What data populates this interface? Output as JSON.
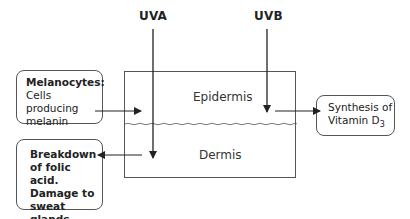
{
  "diagram": {
    "radiation": {
      "uva": {
        "label": "UVA"
      },
      "uvb": {
        "label": "UVB"
      }
    },
    "skin_layers": {
      "epidermis": "Epidermis",
      "dermis": "Dermis"
    },
    "callouts": {
      "melanocytes": {
        "title": "Melanocytes:",
        "line1": "Cells producing",
        "line2": "melanin"
      },
      "uva_effect": {
        "line1": "Breakdown",
        "line2": "of folic acid.",
        "line3": "Damage to",
        "line4": "sweat glands"
      },
      "uvb_effect": {
        "line1": "Synthesis of",
        "line2_main": "Vitamin D",
        "line2_sub": "3"
      }
    },
    "colors": {
      "line": "#222222",
      "box_border": "#555555",
      "background": "#ffffff"
    }
  }
}
